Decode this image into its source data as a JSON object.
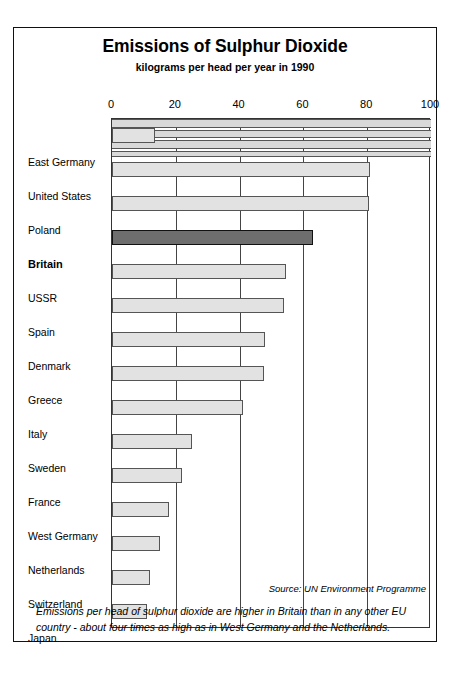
{
  "chart_data": {
    "type": "bar",
    "orientation": "horizontal",
    "title": "Emissions of Sulphur Dioxide",
    "subtitle": "kilograms per head per year in 1990",
    "xlabel": "",
    "ylabel": "",
    "xlim": [
      0,
      100
    ],
    "ticks": [
      "0",
      "20",
      "40",
      "60",
      "80",
      "100"
    ],
    "tick_values": [
      0,
      20,
      40,
      60,
      80,
      100
    ],
    "grid": "vertical",
    "legend": "none",
    "highlight": "Britain",
    "categories": [
      "East Germany",
      "United States",
      "Poland",
      "Britain",
      "USSR",
      "Spain",
      "Denmark",
      "Greece",
      "Italy",
      "Sweden",
      "France",
      "West Germany",
      "Netherlands",
      "Switzerland",
      "Japan"
    ],
    "values": [
      13.5,
      81,
      80.5,
      63,
      54.5,
      54,
      48,
      47.5,
      41,
      25,
      22,
      18,
      15,
      12,
      11
    ],
    "source": "Source: UN Environment Programme",
    "caption": "Emissions per head of sulphur dioxide are higher in Britain than in any other EU country - about four times as high as in West Germany and the Netherlands."
  },
  "colors": {
    "bar_fill": "#e2e2e2",
    "bar_stroke": "#555555",
    "highlight_fill": "#6e6e6e",
    "highlight_stroke": "#111111",
    "frame": "#111111",
    "grid": "#444444",
    "artifact_band": "#d9d9d9"
  }
}
